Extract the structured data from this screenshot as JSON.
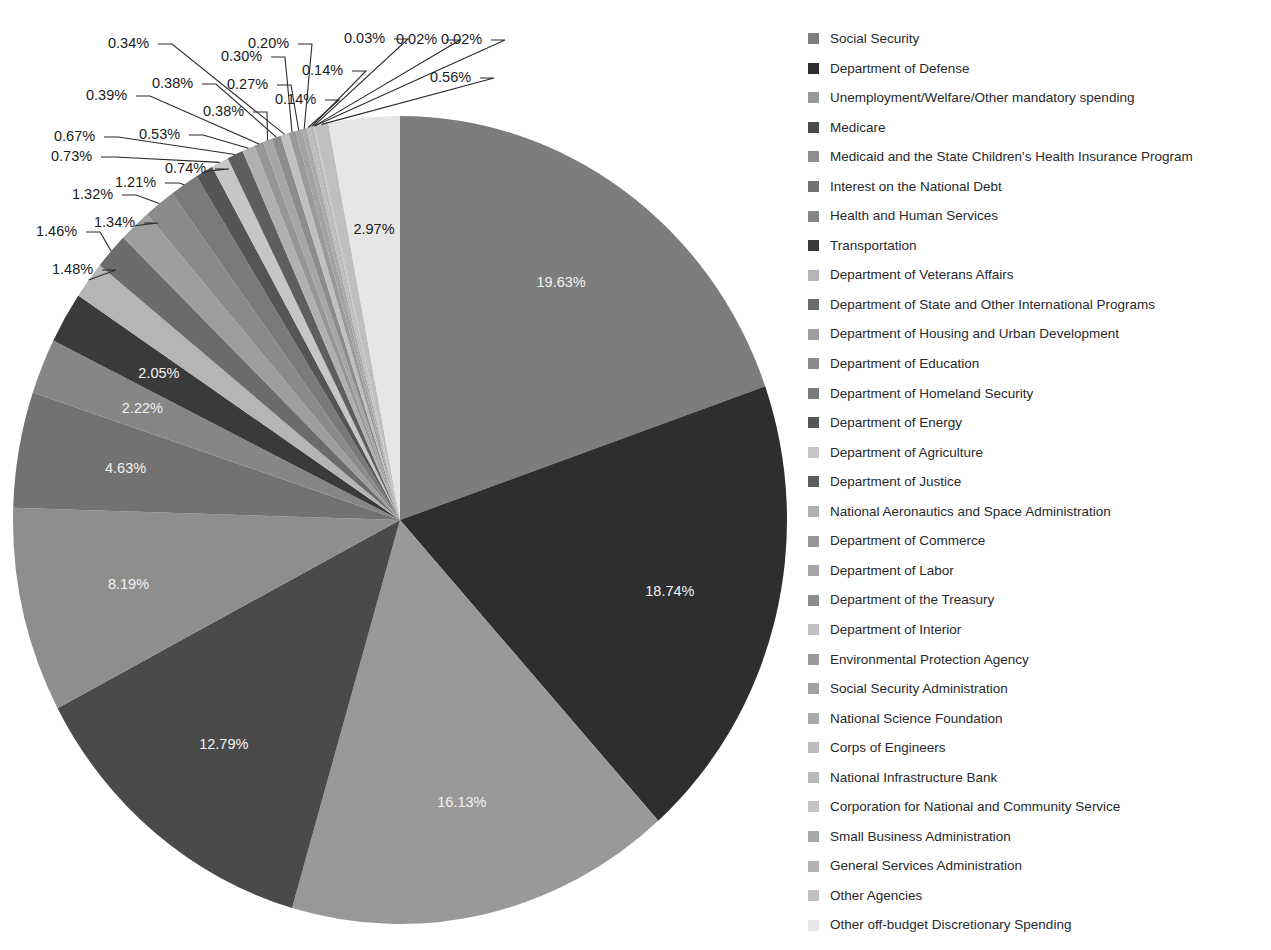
{
  "chart_data": {
    "type": "pie",
    "title": "",
    "subtitle": "",
    "xlabel": "",
    "ylabel": "",
    "legend_position": "right",
    "grid": false,
    "units": "percent",
    "total": 100.0,
    "categories": [
      "Social Security",
      "Department of Defense",
      "Unemployment/Welfare/Other mandatory spending",
      "Medicare",
      "Medicaid and the State Children's Health Insurance Program",
      "Interest on the National Debt",
      "Health and Human Services",
      "Transportation",
      "Department of Veterans Affairs",
      "Department of State and Other International Programs",
      "Department of Housing and Urban Development",
      "Department of Education",
      "Department of Homeland Security",
      "Department of Energy",
      "Department of Agriculture",
      "Department of Justice",
      "National Aeronautics and Space Administration",
      "Department of Commerce",
      "Department of Labor",
      "Department of the Treasury",
      "Department of Interior",
      "Environmental Protection Agency",
      "Social Security Administration",
      "National Science Foundation",
      "Corps of Engineers",
      "National Infrastructure Bank",
      "Corporation for National and Community Service",
      "Small Business Administration",
      "General Services Administration",
      "Other Agencies",
      "Other off-budget Discretionary Spending"
    ],
    "values": [
      19.63,
      18.74,
      16.13,
      12.79,
      8.19,
      4.63,
      2.22,
      2.05,
      1.48,
      1.46,
      1.34,
      1.32,
      1.21,
      0.74,
      0.73,
      0.67,
      0.53,
      0.39,
      0.38,
      0.38,
      0.34,
      0.3,
      0.27,
      0.2,
      0.14,
      0.14,
      0.03,
      0.02,
      0.02,
      0.56,
      2.97
    ],
    "value_labels": [
      "19.63%",
      "18.74%",
      "16.13%",
      "12.79%",
      "8.19%",
      "4.63%",
      "2.22%",
      "2.05%",
      "1.48%",
      "1.46%",
      "1.34%",
      "1.32%",
      "1.21%",
      "0.74%",
      "0.73%",
      "0.67%",
      "0.53%",
      "0.39%",
      "0.38%",
      "0.38%",
      "0.34%",
      "0.30%",
      "0.27%",
      "0.20%",
      "0.14%",
      "0.14%",
      "0.03%",
      "0.02%",
      "0.02%",
      "0.56%",
      "2.97%"
    ],
    "colors": [
      "#7d7d7d",
      "#2e2e2e",
      "#999999",
      "#4a4a4a",
      "#8e8e8e",
      "#727272",
      "#868686",
      "#3a3a3a",
      "#b5b5b5",
      "#6b6b6b",
      "#9e9e9e",
      "#8a8a8a",
      "#7a7a7a",
      "#555555",
      "#c6c6c6",
      "#5e5e5e",
      "#b0b0b0",
      "#969696",
      "#a6a6a6",
      "#8c8c8c",
      "#c0c0c0",
      "#9a9a9a",
      "#a2a2a2",
      "#aaaaaa",
      "#bcbcbc",
      "#b8b8b8",
      "#c4c4c4",
      "#a8a8a8",
      "#b2b2b2",
      "#bfbfbf",
      "#e6e6e6"
    ]
  },
  "legend": {
    "items": [
      {
        "label": "Social Security",
        "color": "#7d7d7d"
      },
      {
        "label": "Department of Defense",
        "color": "#2e2e2e"
      },
      {
        "label": "Unemployment/Welfare/Other mandatory spending",
        "color": "#999999"
      },
      {
        "label": "Medicare",
        "color": "#4a4a4a"
      },
      {
        "label": "Medicaid and the State Children's Health Insurance Program",
        "color": "#8e8e8e"
      },
      {
        "label": "Interest on the National Debt",
        "color": "#727272"
      },
      {
        "label": "Health and Human Services",
        "color": "#868686"
      },
      {
        "label": "Transportation",
        "color": "#3a3a3a"
      },
      {
        "label": "Department of Veterans Affairs",
        "color": "#b5b5b5"
      },
      {
        "label": "Department of State and Other International Programs",
        "color": "#6b6b6b"
      },
      {
        "label": "Department of Housing and Urban Development",
        "color": "#9e9e9e"
      },
      {
        "label": "Department of Education",
        "color": "#8a8a8a"
      },
      {
        "label": "Department of Homeland Security",
        "color": "#7a7a7a"
      },
      {
        "label": "Department of Energy",
        "color": "#555555"
      },
      {
        "label": "Department of Agriculture",
        "color": "#c6c6c6"
      },
      {
        "label": "Department of Justice",
        "color": "#5e5e5e"
      },
      {
        "label": "National Aeronautics and Space Administration",
        "color": "#b0b0b0"
      },
      {
        "label": "Department of Commerce",
        "color": "#969696"
      },
      {
        "label": "Department of Labor",
        "color": "#a6a6a6"
      },
      {
        "label": "Department of the Treasury",
        "color": "#8c8c8c"
      },
      {
        "label": "Department of Interior",
        "color": "#c0c0c0"
      },
      {
        "label": "Environmental Protection Agency",
        "color": "#9a9a9a"
      },
      {
        "label": "Social Security Administration",
        "color": "#a2a2a2"
      },
      {
        "label": "National Science Foundation",
        "color": "#aaaaaa"
      },
      {
        "label": "Corps of Engineers",
        "color": "#bcbcbc"
      },
      {
        "label": "National Infrastructure Bank",
        "color": "#b8b8b8"
      },
      {
        "label": "Corporation for National and Community Service",
        "color": "#c4c4c4"
      },
      {
        "label": "Small Business Administration",
        "color": "#a8a8a8"
      },
      {
        "label": "General Services Administration",
        "color": "#b2b2b2"
      },
      {
        "label": "Other Agencies",
        "color": "#bfbfbf"
      },
      {
        "label": "Other off-budget Discretionary Spending",
        "color": "#e6e6e6"
      }
    ]
  },
  "geometry": {
    "cx": 400,
    "cy": 520,
    "rx": 387,
    "ry": 404,
    "start_angle_deg": -90,
    "inner_label_radius_factor": 0.72,
    "callout_threshold_percent": 1.6
  },
  "callouts": [
    {
      "label": "1.48%",
      "x": 52,
      "y": 274
    },
    {
      "label": "1.46%",
      "x": 36,
      "y": 236
    },
    {
      "label": "1.34%",
      "x": 94,
      "y": 227
    },
    {
      "label": "1.32%",
      "x": 72,
      "y": 199
    },
    {
      "label": "1.21%",
      "x": 115,
      "y": 187
    },
    {
      "label": "0.74%",
      "x": 165,
      "y": 173
    },
    {
      "label": "0.73%",
      "x": 51,
      "y": 161
    },
    {
      "label": "0.67%",
      "x": 54,
      "y": 141
    },
    {
      "label": "0.53%",
      "x": 139,
      "y": 139
    },
    {
      "label": "0.39%",
      "x": 86,
      "y": 100
    },
    {
      "label": "0.38%",
      "x": 203,
      "y": 116
    },
    {
      "label": "0.38%",
      "x": 152,
      "y": 88
    },
    {
      "label": "0.34%",
      "x": 108,
      "y": 48
    },
    {
      "label": "0.30%",
      "x": 221,
      "y": 61
    },
    {
      "label": "0.27%",
      "x": 227,
      "y": 89
    },
    {
      "label": "0.20%",
      "x": 248,
      "y": 48
    },
    {
      "label": "0.14%",
      "x": 275,
      "y": 104
    },
    {
      "label": "0.14%",
      "x": 302,
      "y": 75
    },
    {
      "label": "0.03%",
      "x": 344,
      "y": 43
    },
    {
      "label": "0.02%",
      "x": 396,
      "y": 44
    },
    {
      "label": "0.02%",
      "x": 441,
      "y": 44
    },
    {
      "label": "0.56%",
      "x": 430,
      "y": 82
    }
  ]
}
